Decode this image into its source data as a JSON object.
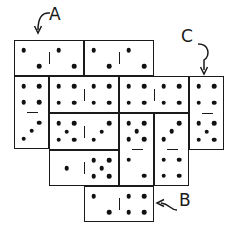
{
  "diagram": {
    "title": "",
    "labels": [
      {
        "id": "A",
        "text": "A",
        "x": 49,
        "y": 14
      },
      {
        "id": "B",
        "text": "B",
        "x": 179,
        "y": 200
      },
      {
        "id": "C",
        "text": "C",
        "x": 181,
        "y": 36
      }
    ],
    "dominoes": [
      {
        "id": "d1",
        "orientation": "horizontal",
        "x": 14,
        "y": 40,
        "w": 70,
        "h": 36,
        "values": [
          2,
          2
        ],
        "label": "A"
      },
      {
        "id": "d2",
        "orientation": "horizontal",
        "x": 84,
        "y": 40,
        "w": 70,
        "h": 36,
        "values": [
          2,
          2
        ]
      },
      {
        "id": "d3",
        "orientation": "vertical",
        "x": 14,
        "y": 76,
        "w": 35,
        "h": 73,
        "values": [
          4,
          3
        ]
      },
      {
        "id": "d4",
        "orientation": "horizontal",
        "x": 49,
        "y": 76,
        "w": 70,
        "h": 37,
        "values": [
          4,
          4
        ]
      },
      {
        "id": "d5",
        "orientation": "horizontal",
        "x": 119,
        "y": 76,
        "w": 70,
        "h": 37,
        "values": [
          4,
          4
        ]
      },
      {
        "id": "d6",
        "orientation": "vertical",
        "x": 189,
        "y": 76,
        "w": 35,
        "h": 74,
        "values": [
          4,
          5
        ],
        "label": "C"
      },
      {
        "id": "d7",
        "orientation": "horizontal",
        "x": 49,
        "y": 113,
        "w": 70,
        "h": 37,
        "values": [
          5,
          3
        ]
      },
      {
        "id": "d8",
        "orientation": "vertical",
        "x": 119,
        "y": 113,
        "w": 35,
        "h": 73,
        "values": [
          5,
          2
        ]
      },
      {
        "id": "d9",
        "orientation": "vertical",
        "x": 154,
        "y": 113,
        "w": 35,
        "h": 73,
        "values": [
          3,
          4
        ]
      },
      {
        "id": "d10",
        "orientation": "horizontal",
        "x": 49,
        "y": 150,
        "w": 70,
        "h": 36,
        "values": [
          1,
          5
        ]
      },
      {
        "id": "d11",
        "orientation": "horizontal",
        "x": 84,
        "y": 186,
        "w": 70,
        "h": 36,
        "values": [
          2,
          4
        ],
        "label": "B"
      }
    ]
  }
}
